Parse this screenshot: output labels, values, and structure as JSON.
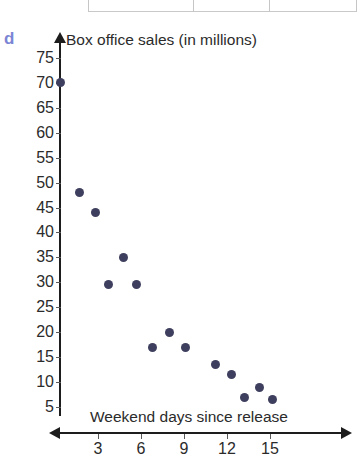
{
  "part_label": "d",
  "chart_data": {
    "type": "scatter",
    "title": "",
    "xlabel": "Weekend days since release",
    "ylabel": "Box office sales (in millions)",
    "xlim": [
      0,
      17
    ],
    "ylim": [
      0,
      77
    ],
    "xticks": [
      3,
      6,
      9,
      12,
      15
    ],
    "yticks": [
      5,
      10,
      15,
      20,
      25,
      30,
      35,
      40,
      45,
      50,
      55,
      60,
      65,
      70,
      75
    ],
    "xtick_labels": [
      "3",
      "6",
      "9",
      "12",
      "15"
    ],
    "ytick_labels": [
      "5",
      "10",
      "15",
      "20",
      "25",
      "30",
      "35",
      "40",
      "45",
      "50",
      "55",
      "60",
      "65",
      "70",
      "75"
    ],
    "grid": false,
    "legend": false,
    "marker_color": "#3e3f5e",
    "axis_color": "#1d1d1d",
    "points": [
      {
        "x": 0.4,
        "y": 70
      },
      {
        "x": 1.7,
        "y": 48
      },
      {
        "x": 2.8,
        "y": 44
      },
      {
        "x": 4.8,
        "y": 35
      },
      {
        "x": 3.7,
        "y": 29.5
      },
      {
        "x": 5.7,
        "y": 29.5
      },
      {
        "x": 8.0,
        "y": 20
      },
      {
        "x": 6.8,
        "y": 17
      },
      {
        "x": 9.1,
        "y": 17
      },
      {
        "x": 11.2,
        "y": 13.5
      },
      {
        "x": 12.3,
        "y": 11.5
      },
      {
        "x": 14.3,
        "y": 9
      },
      {
        "x": 13.2,
        "y": 7
      },
      {
        "x": 15.2,
        "y": 6.5
      }
    ]
  }
}
